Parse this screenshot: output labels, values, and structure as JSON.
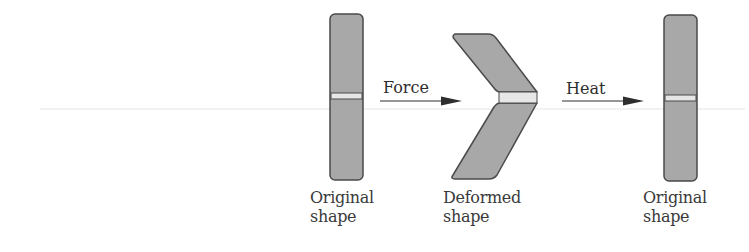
{
  "figure": {
    "type": "shape-memory process diagram",
    "stages": [
      {
        "id": "original-1",
        "label_line1": "Original",
        "label_line2": "shape"
      },
      {
        "id": "deformed",
        "label_line1": "Deformed",
        "label_line2": "shape"
      },
      {
        "id": "original-2",
        "label_line1": "Original",
        "label_line2": "shape"
      }
    ],
    "arrows": [
      {
        "id": "force",
        "label": "Force"
      },
      {
        "id": "heat",
        "label": "Heat"
      }
    ],
    "colors": {
      "fill": "#a8a8a8",
      "stroke": "#4a4a4a",
      "band": "#e6e6e6",
      "text": "#3a3a3a"
    }
  }
}
